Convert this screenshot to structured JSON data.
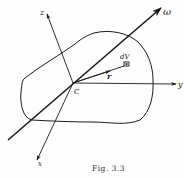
{
  "figure": {
    "caption": "Fig. 3.3",
    "labels": {
      "origin": "C",
      "x_axis": "x",
      "y_axis": "y",
      "z_axis": "z",
      "omega": "ω",
      "position_vector": "r",
      "volume_element": "dV"
    },
    "colors": {
      "ink": "#1a1a1a",
      "background": "#fdfdfd"
    }
  }
}
